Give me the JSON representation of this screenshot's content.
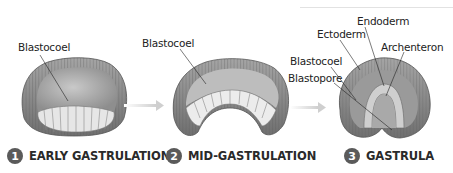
{
  "figure": {
    "stages": [
      {
        "number": "1",
        "caption": "EARLY GASTRULATION",
        "labels": [
          "Blastocoel"
        ]
      },
      {
        "number": "2",
        "caption": "MID-GASTRULATION",
        "labels": [
          "Blastocoel"
        ]
      },
      {
        "number": "3",
        "caption": "GASTRULA",
        "labels": [
          "Endoderm",
          "Ectoderm",
          "Archenteron",
          "Blastocoel",
          "Blastopore"
        ]
      }
    ],
    "colors": {
      "cell_outer": "#8a8a8a",
      "cell_light": "#e8e8e8",
      "cavity": "#bdbdbd",
      "arrow": "#d0d0d0",
      "number_badge": "#5a5a5a",
      "text": "#222222"
    }
  }
}
